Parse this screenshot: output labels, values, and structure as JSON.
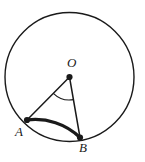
{
  "figure": {
    "background_color": "#ffffff",
    "stroke_color": "#1a1a1a",
    "labels": {
      "center": "O",
      "point_a": "A",
      "point_b": "B"
    },
    "icons": {
      "circle": "circle-outline-icon",
      "radius_a": "radius-segment-icon",
      "radius_b": "radius-segment-icon",
      "angle": "angle-arc-icon",
      "arc": "bold-arc-icon"
    }
  },
  "chart_data": {
    "type": "diagram",
    "subtype": "euclidean-circle-geometry",
    "xlabel": "",
    "ylabel": "",
    "canvas": {
      "width": 145,
      "height": 162
    },
    "circle": {
      "center_label": "O",
      "center_px": [
        69.5,
        77
      ],
      "radius_px": 64.5,
      "stroke_width": 1.4,
      "stroke_color": "#1a1a1a",
      "fill": "none"
    },
    "points": [
      {
        "label": "O",
        "role": "center",
        "x_px": 69.5,
        "y_px": 77,
        "marker": "filled-dot",
        "marker_radius_px": 3.1,
        "label_offset_px": [
          -2,
          -20
        ]
      },
      {
        "label": "A",
        "role": "on-circle",
        "x_px": 27,
        "y_px": 120,
        "marker": "filled-dot",
        "marker_radius_px": 3.1,
        "label_offset_px": [
          -12,
          6
        ],
        "angle_deg": 225.4
      },
      {
        "label": "B",
        "role": "on-circle",
        "x_px": 80,
        "y_px": 137.5,
        "marker": "filled-dot",
        "marker_radius_px": 3.1,
        "label_offset_px": [
          0,
          5
        ],
        "angle_deg": 279.3
      }
    ],
    "segments": [
      {
        "name": "OA",
        "from": "O",
        "to": "A",
        "stroke_width": 1.5,
        "stroke_color": "#1a1a1a"
      },
      {
        "name": "OB",
        "from": "O",
        "to": "B",
        "stroke_width": 1.5,
        "stroke_color": "#1a1a1a"
      }
    ],
    "highlighted_arc": {
      "name": "arc AB",
      "from": "A",
      "to": "B",
      "type": "minor",
      "sweep_deg": 53.9,
      "stroke_width": 3.2,
      "stroke_color": "#1a1a1a"
    },
    "angle_mark": {
      "vertex": "O",
      "from_ray": "OA",
      "to_ray": "OB",
      "radius_px": 23,
      "stroke_width": 1.1,
      "stroke_color": "#1a1a1a",
      "measure_label": ""
    },
    "grid": false,
    "legend": false
  }
}
